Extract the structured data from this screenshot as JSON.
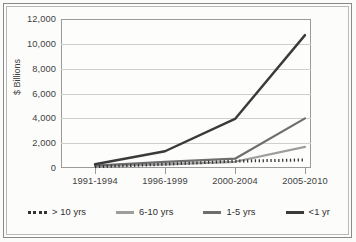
{
  "chart_data": {
    "type": "line",
    "title": "",
    "xlabel": "",
    "ylabel": "$ Billions",
    "categories": [
      "1991-1994",
      "1996-1999",
      "2000-2004",
      "2005-2010"
    ],
    "ylim": [
      0,
      12000
    ],
    "ytick_values": [
      0,
      2000,
      4000,
      6000,
      8000,
      10000,
      12000
    ],
    "ytick_labels": [
      "0",
      "2,000",
      "4,000",
      "6,000",
      "8,000",
      "10,000",
      "12,000"
    ],
    "grid": true,
    "legend_position": "bottom",
    "series": [
      {
        "name": "> 10 yrs",
        "values": [
          100,
          300,
          550,
          650
        ],
        "color": "#333333",
        "style": "dotted"
      },
      {
        "name": "6-10 yrs",
        "values": [
          150,
          300,
          500,
          1700
        ],
        "color": "#9d9d9d",
        "style": "solid"
      },
      {
        "name": "1-5 yrs",
        "values": [
          200,
          500,
          750,
          4000
        ],
        "color": "#6e6e6e",
        "style": "solid"
      },
      {
        "name": "<1 yr",
        "values": [
          300,
          1350,
          3950,
          10700
        ],
        "color": "#3a3a3a",
        "style": "solid"
      }
    ]
  },
  "axis": {
    "y_title": "$ Billions"
  },
  "legend": {
    "items": [
      {
        "label": "> 10 yrs"
      },
      {
        "label": "6-10 yrs"
      },
      {
        "label": "1-5 yrs"
      },
      {
        "label": "<1 yr"
      }
    ]
  }
}
